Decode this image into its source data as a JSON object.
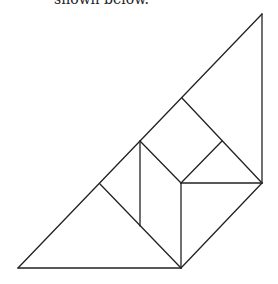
{
  "caption": "shown below.",
  "figure": {
    "pieces": [
      "large-triangle-left",
      "parallelogram",
      "square",
      "small-triangle-top",
      "small-triangle-right",
      "medium-triangle",
      "large-triangle-top"
    ]
  }
}
